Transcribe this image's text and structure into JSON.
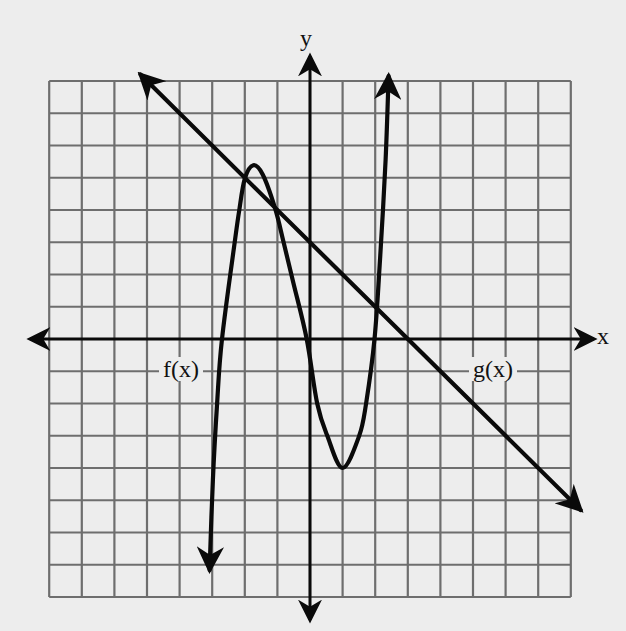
{
  "chart_data": {
    "type": "line",
    "title": "",
    "xlabel": "x",
    "ylabel": "y",
    "xlim": [
      -8,
      8
    ],
    "ylim": [
      -8,
      8
    ],
    "grid": true,
    "grid_step": 1,
    "tick_labels": false,
    "series": [
      {
        "name": "f(x)",
        "kind": "cubic-like curve",
        "arrows": "both ends",
        "points": [
          [
            -3.08,
            -7.16
          ],
          [
            -2.98,
            -4.37
          ],
          [
            -2.85,
            -2.0
          ],
          [
            -2.7,
            0.0
          ],
          [
            -2.31,
            3.0
          ],
          [
            -2.17,
            4.0
          ],
          [
            -2.0,
            4.97
          ],
          [
            -1.74,
            5.39
          ],
          [
            -1.45,
            5.1
          ],
          [
            -1.07,
            4.05
          ],
          [
            -0.81,
            3.0
          ],
          [
            -0.5,
            1.7
          ],
          [
            -0.1,
            0.0
          ],
          [
            0.22,
            -2.0
          ],
          [
            0.53,
            -3.0
          ],
          [
            1.0,
            -4.0
          ],
          [
            1.51,
            -3.0
          ],
          [
            1.72,
            -2.0
          ],
          [
            1.98,
            0.0
          ],
          [
            2.15,
            2.5
          ],
          [
            2.32,
            5.55
          ],
          [
            2.41,
            8.15
          ]
        ],
        "local_max": [
          -1.74,
          5.39
        ],
        "local_min": [
          1.0,
          -4.0
        ],
        "x_intercepts": [
          -2.7,
          -0.1,
          1.98
        ]
      },
      {
        "name": "g(x)",
        "kind": "line",
        "equation": "g(x) = 3 - x",
        "slope": -1,
        "y_intercept": 3,
        "x_intercept": 3,
        "arrows": "both ends",
        "points": [
          [
            -5.2,
            8.2
          ],
          [
            8.3,
            -5.3
          ]
        ]
      }
    ],
    "intersections": [
      [
        -2.0,
        5.0
      ],
      [
        -1.07,
        4.05
      ],
      [
        2.0,
        1.0
      ]
    ],
    "annotations": [
      {
        "text": "f(x)",
        "x": -3.9,
        "y": -1
      },
      {
        "text": "g(x)",
        "x": 5.8,
        "y": -1
      }
    ]
  },
  "labels": {
    "x_axis": "x",
    "y_axis": "y",
    "f": "f(x)",
    "g": "g(x)"
  },
  "style": {
    "background": "#ededed",
    "grid_color": "#6e6e6e",
    "curve_color": "#0a0a0a"
  }
}
